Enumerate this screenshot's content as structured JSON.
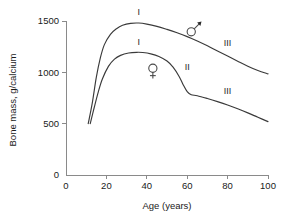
{
  "chart_data": {
    "type": "line",
    "title": "",
    "xlabel": "Age (years)",
    "ylabel": "Bone mass, g/calcium",
    "xlim": [
      0,
      100
    ],
    "ylim": [
      0,
      1500
    ],
    "xticks": [
      0,
      20,
      40,
      60,
      80,
      100
    ],
    "yticks": [
      0,
      500,
      1000,
      1500
    ],
    "xtick_labels": [
      "0",
      "20",
      "40",
      "60",
      "80",
      "100"
    ],
    "ytick_labels": [
      "0",
      "500",
      "1000",
      "1500"
    ],
    "grid": false,
    "legend": "none",
    "series": [
      {
        "name": "male",
        "symbol": "♂",
        "symbol_label": "male-symbol",
        "points": [
          [
            11,
            500
          ],
          [
            13,
            700
          ],
          [
            15,
            950
          ],
          [
            17,
            1140
          ],
          [
            19,
            1270
          ],
          [
            22,
            1370
          ],
          [
            25,
            1425
          ],
          [
            28,
            1458
          ],
          [
            32,
            1477
          ],
          [
            36,
            1480
          ],
          [
            40,
            1470
          ],
          [
            45,
            1448
          ],
          [
            50,
            1418
          ],
          [
            55,
            1385
          ],
          [
            60,
            1348
          ],
          [
            65,
            1305
          ],
          [
            70,
            1258
          ],
          [
            75,
            1208
          ],
          [
            80,
            1158
          ],
          [
            85,
            1108
          ],
          [
            90,
            1060
          ],
          [
            95,
            1018
          ],
          [
            100,
            985
          ]
        ]
      },
      {
        "name": "female",
        "symbol": "♀",
        "symbol_label": "female-symbol",
        "points": [
          [
            12,
            500
          ],
          [
            14,
            660
          ],
          [
            16,
            810
          ],
          [
            18,
            935
          ],
          [
            21,
            1058
          ],
          [
            24,
            1128
          ],
          [
            27,
            1165
          ],
          [
            31,
            1188
          ],
          [
            35,
            1195
          ],
          [
            38,
            1193
          ],
          [
            42,
            1180
          ],
          [
            46,
            1155
          ],
          [
            50,
            1110
          ],
          [
            53,
            1050
          ],
          [
            56,
            960
          ],
          [
            58,
            880
          ],
          [
            60,
            812
          ],
          [
            62,
            782
          ],
          [
            65,
            772
          ],
          [
            70,
            745
          ],
          [
            75,
            715
          ],
          [
            80,
            682
          ],
          [
            85,
            645
          ],
          [
            90,
            605
          ],
          [
            95,
            562
          ],
          [
            100,
            520
          ]
        ]
      }
    ],
    "annotations": [
      {
        "text": "I",
        "name": "phase-one-label-male",
        "x": 36,
        "y": 1560
      },
      {
        "text": "I",
        "name": "phase-one-label-female",
        "x": 36,
        "y": 1270
      },
      {
        "text": "II",
        "name": "phase-two-label-female",
        "x": 60,
        "y": 1020
      },
      {
        "text": "III",
        "name": "phase-three-label-male",
        "x": 80,
        "y": 1255
      },
      {
        "text": "III",
        "name": "phase-three-label-female",
        "x": 80,
        "y": 790
      }
    ],
    "symbols": [
      {
        "name": "male-symbol",
        "glyph": "♂",
        "x": 62,
        "y": 1395
      },
      {
        "name": "female-symbol",
        "glyph": "♀",
        "x": 43,
        "y": 1040
      }
    ],
    "colors": {
      "curve": "#3a3a3a",
      "axis": "#8a8a8a",
      "text": "#1a1a1a",
      "background": "#ffffff"
    }
  }
}
